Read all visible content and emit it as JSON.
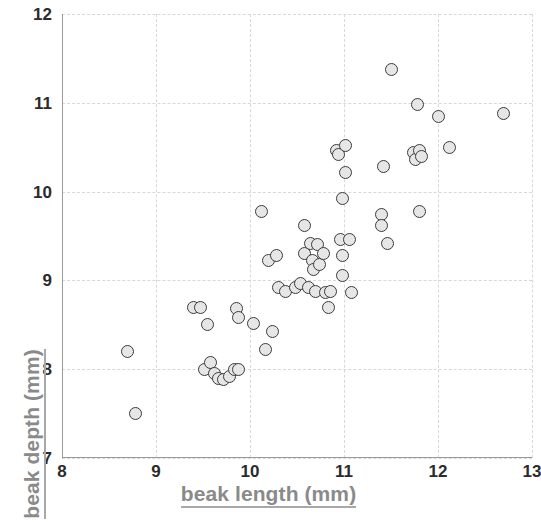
{
  "chart_data": {
    "type": "scatter",
    "title": "",
    "xlabel": "beak length (mm)",
    "ylabel": "beak depth (mm)",
    "xlim": [
      8,
      13
    ],
    "ylim": [
      7,
      12
    ],
    "xticks": [
      8,
      9,
      10,
      11,
      12,
      13
    ],
    "yticks": [
      7,
      8,
      9,
      10,
      11,
      12
    ],
    "xtick_labels": [
      "8",
      "9",
      "10",
      "11",
      "12",
      "13"
    ],
    "ytick_labels": [
      "7",
      "8",
      "9",
      "10",
      "11",
      "12"
    ],
    "grid": true,
    "grid_style": "dashed",
    "grid_color": "#d8d8d8",
    "legend": null,
    "marker": {
      "shape": "circle",
      "fill_color": "#e6e6e6",
      "edge_color": "#3b3b3b",
      "size_px": 13
    },
    "axis_label_color": "#8a8a8a",
    "tick_label_color": "#2b2b2b",
    "background_color": "#ffffff",
    "n_points": 71,
    "points": [
      {
        "x": 8.7,
        "y": 8.2
      },
      {
        "x": 8.78,
        "y": 7.5
      },
      {
        "x": 9.4,
        "y": 8.7
      },
      {
        "x": 9.47,
        "y": 8.7
      },
      {
        "x": 9.55,
        "y": 8.5
      },
      {
        "x": 9.52,
        "y": 8.0
      },
      {
        "x": 9.58,
        "y": 8.08
      },
      {
        "x": 9.62,
        "y": 7.95
      },
      {
        "x": 9.66,
        "y": 7.9
      },
      {
        "x": 9.72,
        "y": 7.88
      },
      {
        "x": 9.78,
        "y": 7.92
      },
      {
        "x": 9.84,
        "y": 8.0
      },
      {
        "x": 9.88,
        "y": 8.0
      },
      {
        "x": 9.86,
        "y": 8.68
      },
      {
        "x": 9.88,
        "y": 8.58
      },
      {
        "x": 10.04,
        "y": 8.52
      },
      {
        "x": 10.12,
        "y": 9.78
      },
      {
        "x": 10.16,
        "y": 8.22
      },
      {
        "x": 10.2,
        "y": 9.22
      },
      {
        "x": 10.24,
        "y": 8.42
      },
      {
        "x": 10.28,
        "y": 9.28
      },
      {
        "x": 10.3,
        "y": 8.92
      },
      {
        "x": 10.38,
        "y": 8.88
      },
      {
        "x": 10.48,
        "y": 8.92
      },
      {
        "x": 10.54,
        "y": 8.96
      },
      {
        "x": 10.58,
        "y": 9.62
      },
      {
        "x": 10.58,
        "y": 9.3
      },
      {
        "x": 10.62,
        "y": 8.92
      },
      {
        "x": 10.64,
        "y": 9.42
      },
      {
        "x": 10.66,
        "y": 9.22
      },
      {
        "x": 10.68,
        "y": 9.12
      },
      {
        "x": 10.7,
        "y": 8.88
      },
      {
        "x": 10.72,
        "y": 9.4
      },
      {
        "x": 10.74,
        "y": 9.18
      },
      {
        "x": 10.78,
        "y": 9.3
      },
      {
        "x": 10.8,
        "y": 8.86
      },
      {
        "x": 10.84,
        "y": 8.7
      },
      {
        "x": 10.86,
        "y": 8.88
      },
      {
        "x": 10.92,
        "y": 10.46
      },
      {
        "x": 10.94,
        "y": 10.42
      },
      {
        "x": 10.96,
        "y": 9.46
      },
      {
        "x": 10.98,
        "y": 9.92
      },
      {
        "x": 10.98,
        "y": 9.28
      },
      {
        "x": 10.98,
        "y": 9.06
      },
      {
        "x": 11.02,
        "y": 10.52
      },
      {
        "x": 11.02,
        "y": 10.22
      },
      {
        "x": 11.06,
        "y": 9.46
      },
      {
        "x": 11.08,
        "y": 8.86
      },
      {
        "x": 11.42,
        "y": 10.28
      },
      {
        "x": 11.4,
        "y": 9.74
      },
      {
        "x": 11.4,
        "y": 9.62
      },
      {
        "x": 11.46,
        "y": 9.42
      },
      {
        "x": 11.5,
        "y": 11.38
      },
      {
        "x": 11.74,
        "y": 10.44
      },
      {
        "x": 11.76,
        "y": 10.36
      },
      {
        "x": 11.78,
        "y": 10.98
      },
      {
        "x": 11.8,
        "y": 10.46
      },
      {
        "x": 11.82,
        "y": 10.4
      },
      {
        "x": 11.8,
        "y": 9.78
      },
      {
        "x": 12.0,
        "y": 10.85
      },
      {
        "x": 12.12,
        "y": 10.5
      },
      {
        "x": 12.7,
        "y": 10.88
      }
    ]
  }
}
